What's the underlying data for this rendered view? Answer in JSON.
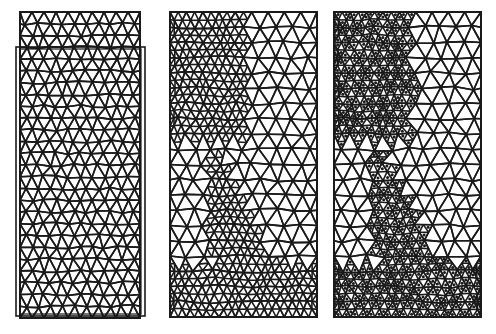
{
  "figure": {
    "colors": {
      "line": "#1a1a1a",
      "background": "#ffffff",
      "dot": "#1a1a1a"
    },
    "panels": [
      {
        "id": "mesh-deformed",
        "label": "Uniform mesh with deformed (displaced) configuration overlay",
        "frame": {
          "x": 20,
          "y": 12,
          "w": 120,
          "h": 306
        },
        "overlay_frame": {
          "x": 16,
          "y": 47,
          "w": 129,
          "h": 269
        },
        "cols": 10,
        "rows": 26,
        "refined": false,
        "dots": false
      },
      {
        "id": "mesh-adaptive",
        "label": "Adaptively refined mesh",
        "frame": {
          "x": 170,
          "y": 12,
          "w": 147,
          "h": 305
        },
        "cols": 9,
        "rows": 20,
        "refined": true,
        "dots": false
      },
      {
        "id": "mesh-adaptive-marked",
        "label": "Adaptively refined mesh with marked elements",
        "frame": {
          "x": 334,
          "y": 12,
          "w": 147,
          "h": 305
        },
        "cols": 9,
        "rows": 20,
        "refined": true,
        "dots": true
      }
    ]
  }
}
